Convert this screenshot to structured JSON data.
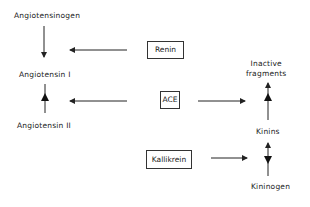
{
  "diagram": {
    "type": "pathway",
    "nodes": {
      "angiotensinogen": "Angiotensinogen",
      "angiotensin_1": "Angiotensin I",
      "angiotensin_2": "Angiotensin II",
      "inactive_line1": "Inactive",
      "inactive_line2": "fragments",
      "kinins": "Kinins",
      "kininogen": "Kininogen"
    },
    "enzymes": {
      "renin": "Renin",
      "ace": "ACE",
      "kallikrein": "Kallikrein"
    },
    "edges": [
      {
        "from": "Angiotensinogen",
        "to": "Angiotensin I",
        "via": "Renin"
      },
      {
        "from": "Angiotensin I",
        "to": "Angiotensin II",
        "via": "ACE"
      },
      {
        "from": "Kinins",
        "to": "Inactive fragments",
        "via": "ACE"
      },
      {
        "from": "Kininogen",
        "to": "Kinins",
        "via": "Kallikrein"
      }
    ]
  }
}
